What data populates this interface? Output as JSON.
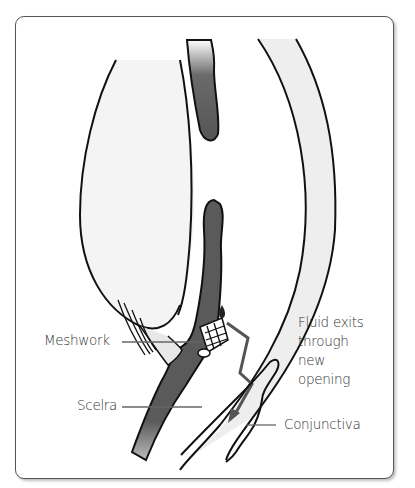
{
  "diagram": {
    "type": "anatomical-cross-section",
    "labels": {
      "meshwork": "Meshwork",
      "scelra": "Scelra",
      "fluid_line1": "Fluid exits",
      "fluid_line2": "through",
      "fluid_line3": "new",
      "fluid_line4": "opening",
      "conjunctiva": "Conjunctiva"
    },
    "colors": {
      "outline": "#111111",
      "tissue_dark": "#5a5a5a",
      "lens_fill": "#f2f2f2",
      "cornea_fill": "#ececec",
      "label_text": "#333333",
      "frame_border": "#555555"
    }
  }
}
